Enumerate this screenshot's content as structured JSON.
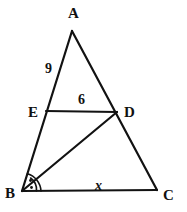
{
  "figure": {
    "background_color": "#ffffff",
    "stroke_color": "#121212",
    "vertices": [
      {
        "name": "A",
        "label": "A",
        "x": 72,
        "y": 31,
        "label_x": 68,
        "label_y": 18
      },
      {
        "name": "B",
        "label": "B",
        "x": 22,
        "y": 191,
        "label_x": 5,
        "label_y": 198
      },
      {
        "name": "C",
        "label": "C",
        "x": 157,
        "y": 190,
        "label_x": 163,
        "label_y": 200
      },
      {
        "name": "D",
        "label": "D",
        "x": 117,
        "y": 112,
        "label_x": 124,
        "label_y": 117
      },
      {
        "name": "E",
        "label": "E",
        "x": 46,
        "y": 111,
        "label_x": 28,
        "label_y": 117
      }
    ],
    "segments": [
      {
        "name": "side-AB",
        "from": "A",
        "to": "B"
      },
      {
        "name": "side-AC",
        "from": "A",
        "to": "C"
      },
      {
        "name": "side-BC",
        "from": "B",
        "to": "C"
      },
      {
        "name": "segment-ED",
        "from": "E",
        "to": "D"
      },
      {
        "name": "cevian-BD",
        "from": "B",
        "to": "D"
      }
    ],
    "measure_labels": [
      {
        "name": "label-AE-9",
        "text": "9",
        "x": 45,
        "y": 73,
        "style": "upright"
      },
      {
        "name": "label-ED-6",
        "text": "6",
        "x": 78,
        "y": 104,
        "style": "upright"
      },
      {
        "name": "label-BC-x",
        "text": "x",
        "x": 95,
        "y": 190,
        "style": "italic"
      }
    ],
    "angle_marks": {
      "name": "angle-bisector-marks-at-B",
      "vertex": "B",
      "description": "Two congruent angle arcs with dot marks at vertex B showing BD bisects angle ABC",
      "arc_count": 2,
      "dot_count": 2
    }
  }
}
